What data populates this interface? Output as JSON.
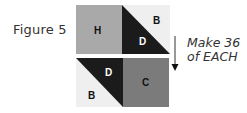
{
  "figure": {
    "caption": "Figure 5",
    "instruction_line1": "Make 36",
    "instruction_line2": "of EACH"
  },
  "colors": {
    "H": "#a9a9a9",
    "B": "#efefef",
    "D": "#1b1b1b",
    "C": "#7b7b7b",
    "border": "#555555"
  },
  "top_unit": {
    "square_label": "H",
    "triangle_upper_label": "B",
    "triangle_lower_label": "D"
  },
  "bottom_unit": {
    "triangle_upper_label": "D",
    "triangle_lower_label": "B",
    "square_label": "C"
  }
}
